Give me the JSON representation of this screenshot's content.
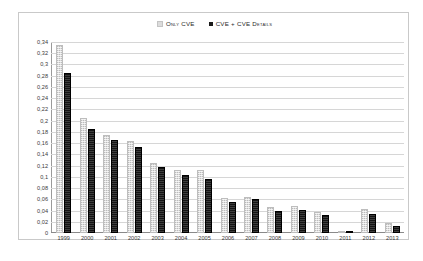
{
  "legend": {
    "position": "top-center",
    "entries": [
      {
        "label": "Only CVE",
        "swatch": "light-swatch-icon",
        "color": "#dedede"
      },
      {
        "label": "CVE + CVE Details",
        "swatch": "dark-swatch-icon",
        "color": "#141414"
      }
    ]
  },
  "axis": {
    "y_ticks": [
      "0,34",
      "0,32",
      "0,3",
      "0,28",
      "0,26",
      "0,24",
      "0,22",
      "0,2",
      "0,18",
      "0,16",
      "0,14",
      "0,12",
      "0,1",
      "0,08",
      "0,06",
      "0,04",
      "0,02",
      "0"
    ],
    "x_ticks": [
      "1999",
      "2000",
      "2001",
      "2002",
      "2003",
      "2004",
      "2005",
      "2006",
      "2007",
      "2008",
      "2009",
      "2010",
      "2011",
      "2012",
      "2013"
    ]
  },
  "chart_data": {
    "type": "bar",
    "title": "",
    "subtitle": "",
    "xlabel": "",
    "ylabel": "",
    "ylim": [
      0,
      0.34
    ],
    "ytick_step": 0.02,
    "decimal_separator": ",",
    "grid": true,
    "legend_position": "top-center",
    "categories": [
      "1999",
      "2000",
      "2001",
      "2002",
      "2003",
      "2004",
      "2005",
      "2006",
      "2007",
      "2008",
      "2009",
      "2010",
      "2011",
      "2012",
      "2013"
    ],
    "series": [
      {
        "name": "Only CVE",
        "color": "#dedede",
        "values": [
          0.335,
          0.205,
          0.175,
          0.163,
          0.125,
          0.113,
          0.113,
          0.062,
          0.065,
          0.046,
          0.048,
          0.038,
          0.004,
          0.042,
          0.017
        ]
      },
      {
        "name": "CVE + CVE Details",
        "color": "#141414",
        "values": [
          0.285,
          0.185,
          0.165,
          0.153,
          0.117,
          0.103,
          0.097,
          0.056,
          0.061,
          0.04,
          0.041,
          0.032,
          0.004,
          0.034,
          0.012
        ]
      }
    ]
  }
}
